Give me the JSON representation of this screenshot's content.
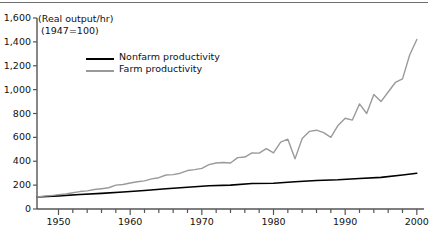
{
  "chart_data": {
    "type": "line",
    "title": "",
    "subtitle": "",
    "xlabel": "",
    "ylabel": "(Real output/hr)",
    "axis_note_line1": "(Real output/hr)",
    "axis_note_line2": "(1947=100)",
    "xlim": [
      1947,
      2001
    ],
    "ylim": [
      0,
      1600
    ],
    "ytick_values": [
      0,
      200,
      400,
      600,
      800,
      1000,
      1200,
      1400,
      1600
    ],
    "ytick_labels": [
      "0",
      "200",
      "400",
      "600",
      "800",
      "1,000",
      "1,200",
      "1,400",
      "1,600"
    ],
    "xtick_values": [
      1950,
      1960,
      1970,
      1980,
      1990,
      2000
    ],
    "xtick_labels": [
      "1950",
      "1960",
      "1970",
      "1980",
      "1990",
      "2000"
    ],
    "x_minor_interval": 2,
    "grid": false,
    "legend_position": "upper-left-inside",
    "series": [
      {
        "name": "Nonfarm productivity",
        "color": "#000000",
        "x": [
          1947,
          1950,
          1953,
          1956,
          1959,
          1962,
          1965,
          1968,
          1971,
          1974,
          1977,
          1980,
          1983,
          1986,
          1989,
          1992,
          1995,
          1998,
          2000
        ],
        "values": [
          100,
          110,
          122,
          131,
          142,
          155,
          170,
          182,
          195,
          200,
          213,
          216,
          228,
          239,
          245,
          256,
          265,
          285,
          300
        ]
      },
      {
        "name": "Farm productivity",
        "color": "#9a9a9a",
        "x": [
          1947,
          1948,
          1949,
          1950,
          1951,
          1952,
          1953,
          1954,
          1955,
          1956,
          1957,
          1958,
          1959,
          1960,
          1961,
          1962,
          1963,
          1964,
          1965,
          1966,
          1967,
          1968,
          1969,
          1970,
          1971,
          1972,
          1973,
          1974,
          1975,
          1976,
          1977,
          1978,
          1979,
          1980,
          1981,
          1982,
          1983,
          1984,
          1985,
          1986,
          1987,
          1988,
          1989,
          1990,
          1991,
          1992,
          1993,
          1994,
          1995,
          1996,
          1997,
          1998,
          1999,
          2000
        ],
        "values": [
          100,
          108,
          112,
          120,
          126,
          136,
          146,
          152,
          163,
          170,
          178,
          200,
          205,
          218,
          228,
          236,
          252,
          262,
          285,
          288,
          300,
          322,
          330,
          340,
          372,
          385,
          390,
          385,
          430,
          435,
          470,
          468,
          505,
          470,
          560,
          585,
          420,
          590,
          650,
          660,
          640,
          600,
          700,
          760,
          745,
          880,
          800,
          960,
          900,
          980,
          1060,
          1090,
          1290,
          1420
        ]
      }
    ]
  },
  "legend": {
    "items": [
      {
        "label": "Nonfarm productivity",
        "color": "#000000"
      },
      {
        "label": "Farm productivity",
        "color": "#9a9a9a"
      }
    ]
  }
}
